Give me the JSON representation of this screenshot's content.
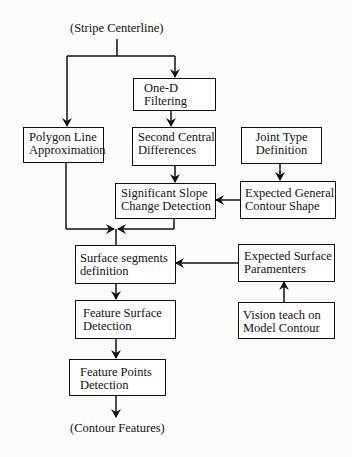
{
  "diagram": {
    "input_label": "(Stripe Centerline)",
    "output_label": "(Contour Features)",
    "boxes": {
      "one_d_filtering": {
        "lines": [
          "One-D",
          "Filtering"
        ]
      },
      "polygon_line": {
        "lines": [
          "Polygon Line",
          "Approximation"
        ]
      },
      "second_central": {
        "lines": [
          "Second Central",
          "Differences"
        ]
      },
      "joint_type": {
        "lines": [
          "Joint Type",
          "Definition"
        ]
      },
      "significant_slope": {
        "lines": [
          "Significant Slope",
          "Change Detection"
        ]
      },
      "expected_general": {
        "lines": [
          "Expected General",
          "Contour Shape"
        ]
      },
      "surface_segments": {
        "lines": [
          "Surface segments",
          "definition"
        ]
      },
      "expected_surface": {
        "lines": [
          "Expected Surface",
          "Paramenters"
        ]
      },
      "feature_surface": {
        "lines": [
          "Feature Surface",
          "Detection"
        ]
      },
      "vision_teach": {
        "lines": [
          "Vision teach on",
          "Model Contour"
        ]
      },
      "feature_points": {
        "lines": [
          "Feature Points",
          "Detection"
        ]
      }
    },
    "edges": [
      [
        "input",
        "one_d_filtering"
      ],
      [
        "input",
        "polygon_line"
      ],
      [
        "one_d_filtering",
        "second_central"
      ],
      [
        "second_central",
        "significant_slope"
      ],
      [
        "joint_type",
        "expected_general"
      ],
      [
        "expected_general",
        "significant_slope"
      ],
      [
        "polygon_line",
        "surface_segments"
      ],
      [
        "significant_slope",
        "surface_segments"
      ],
      [
        "expected_surface",
        "surface_segments"
      ],
      [
        "vision_teach",
        "expected_surface"
      ],
      [
        "surface_segments",
        "feature_surface"
      ],
      [
        "feature_surface",
        "feature_points"
      ],
      [
        "feature_points",
        "output"
      ]
    ]
  }
}
